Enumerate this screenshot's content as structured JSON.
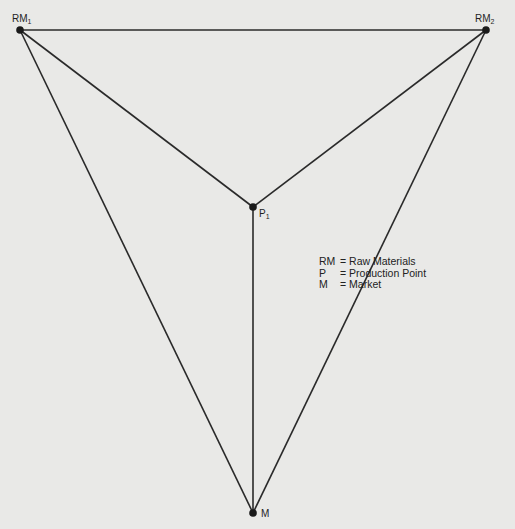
{
  "diagram": {
    "type": "location-triangle",
    "nodes": [
      {
        "id": "RM1",
        "label": "RM",
        "subscript": "1",
        "x": 20,
        "y": 30
      },
      {
        "id": "RM2",
        "label": "RM",
        "subscript": "2",
        "x": 486,
        "y": 30
      },
      {
        "id": "P1",
        "label": "P",
        "subscript": "1",
        "x": 253,
        "y": 207
      },
      {
        "id": "M",
        "label": "M",
        "subscript": "",
        "x": 253,
        "y": 513
      }
    ],
    "edges": [
      {
        "from": "RM1",
        "to": "RM2"
      },
      {
        "from": "RM1",
        "to": "M"
      },
      {
        "from": "RM2",
        "to": "M"
      },
      {
        "from": "RM1",
        "to": "P1"
      },
      {
        "from": "RM2",
        "to": "P1"
      },
      {
        "from": "P1",
        "to": "M"
      }
    ],
    "colors": {
      "line": "#2a2a2a",
      "node": "#1a1a1a",
      "background": "#e9e9e7"
    }
  },
  "legend": {
    "items": [
      {
        "key": "RM",
        "value": "= Raw Materials"
      },
      {
        "key": "P",
        "value": "= Production Point"
      },
      {
        "key": "M",
        "value": "= Market"
      }
    ]
  }
}
